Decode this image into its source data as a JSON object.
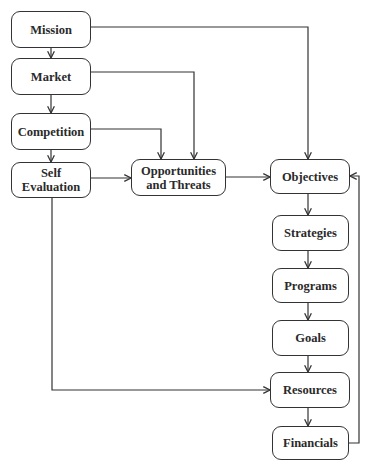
{
  "diagram": {
    "type": "flowchart",
    "nodes": {
      "mission": "Mission",
      "market": "Market",
      "competition": "Competition",
      "self_evaluation": "Self\nEvaluation",
      "opportunities_threats": "Opportunities\nand Threats",
      "objectives": "Objectives",
      "strategies": "Strategies",
      "programs": "Programs",
      "goals": "Goals",
      "resources": "Resources",
      "financials": "Financials"
    },
    "edges": [
      {
        "from": "Mission",
        "to": "Market"
      },
      {
        "from": "Market",
        "to": "Competition"
      },
      {
        "from": "Competition",
        "to": "Self Evaluation"
      },
      {
        "from": "Mission",
        "to": "Objectives"
      },
      {
        "from": "Market",
        "to": "Opportunities and Threats"
      },
      {
        "from": "Competition",
        "to": "Opportunities and Threats"
      },
      {
        "from": "Self Evaluation",
        "to": "Opportunities and Threats"
      },
      {
        "from": "Opportunities and Threats",
        "to": "Objectives"
      },
      {
        "from": "Objectives",
        "to": "Strategies"
      },
      {
        "from": "Strategies",
        "to": "Programs"
      },
      {
        "from": "Programs",
        "to": "Goals"
      },
      {
        "from": "Goals",
        "to": "Resources"
      },
      {
        "from": "Self Evaluation",
        "to": "Resources"
      },
      {
        "from": "Resources",
        "to": "Financials"
      },
      {
        "from": "Financials",
        "to": "Objectives"
      }
    ],
    "colors": {
      "line": "#333333",
      "text": "#2a2a2a",
      "background": "#ffffff"
    }
  }
}
